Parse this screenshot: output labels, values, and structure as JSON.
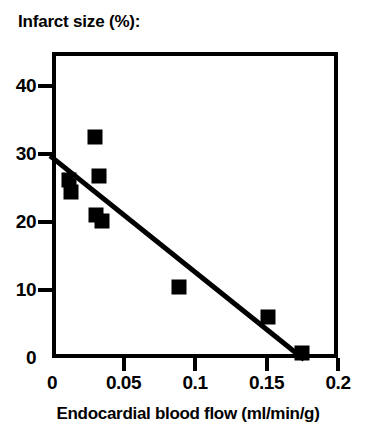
{
  "chart_data": {
    "type": "scatter",
    "title": "Infarct size (%):",
    "xlabel": "Endocardial blood flow (ml/min/g)",
    "ylabel": "Infarct size (%)",
    "xlim": [
      0,
      0.2
    ],
    "ylim": [
      0,
      45
    ],
    "xticks": [
      0,
      0.05,
      0.1,
      0.15,
      0.2
    ],
    "xticklabels": [
      "0",
      "0.05",
      "0.1",
      "0.15",
      "0.2"
    ],
    "yticks": [
      0,
      10,
      20,
      30,
      40
    ],
    "yticklabels": [
      "0",
      "10",
      "20",
      "30",
      "40"
    ],
    "grid": false,
    "legend": null,
    "marker": "square",
    "marker_color": "#000000",
    "marker_size_px": 15,
    "points": [
      {
        "x": 0.012,
        "y": 26.2
      },
      {
        "x": 0.013,
        "y": 24.4
      },
      {
        "x": 0.03,
        "y": 32.5
      },
      {
        "x": 0.033,
        "y": 26.7
      },
      {
        "x": 0.031,
        "y": 21.0
      },
      {
        "x": 0.035,
        "y": 20.2
      },
      {
        "x": 0.089,
        "y": 10.5
      },
      {
        "x": 0.151,
        "y": 6.0
      },
      {
        "x": 0.175,
        "y": 0.8
      }
    ],
    "series": [
      {
        "name": "Infarct size vs endocardial blood flow",
        "x": [
          0.012,
          0.013,
          0.03,
          0.033,
          0.031,
          0.035,
          0.089,
          0.151,
          0.175
        ],
        "values": [
          26.2,
          24.4,
          32.5,
          26.7,
          21.0,
          20.2,
          10.5,
          6.0,
          0.8
        ]
      }
    ],
    "fit_line": {
      "type": "linear-regression",
      "color": "#000000",
      "width_px": 5,
      "x_start": 0.0,
      "y_start": 29.5,
      "x_end": 0.175,
      "y_end": 0.0
    }
  },
  "axes": {
    "frame_color": "#000000",
    "frame_width_px": 4
  }
}
